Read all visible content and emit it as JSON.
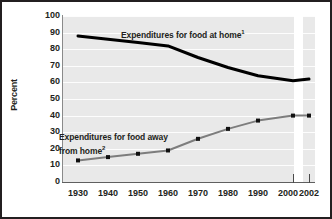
{
  "chart_data": {
    "type": "line",
    "title": "",
    "xlabel": "",
    "ylabel": "Percent",
    "ylim": [
      0,
      100
    ],
    "ytick_step": 10,
    "grid": true,
    "legend": "inline-labels",
    "axis_break_between": [
      "2000",
      "2002"
    ],
    "categories": [
      "1930",
      "1940",
      "1950",
      "1960",
      "1970",
      "1980",
      "1990",
      "2000",
      "2002"
    ],
    "series": [
      {
        "name": "Expenditures for food at home",
        "footnote": "1",
        "style": "thick-black-line-no-markers",
        "color": "#000000",
        "values": [
          88,
          86,
          84,
          82,
          75,
          69,
          64,
          61,
          62
        ]
      },
      {
        "name": "Expenditures for food away from home",
        "footnote": "2",
        "style": "gray-line-with-square-markers",
        "color": "#808080",
        "values": [
          13,
          15,
          17,
          19,
          26,
          32,
          37,
          40,
          40
        ]
      }
    ]
  },
  "axes": {
    "y_label": "Percent",
    "y_ticks": [
      "100",
      "90",
      "80",
      "70",
      "60",
      "50",
      "40",
      "30",
      "20",
      "10",
      "0"
    ],
    "x_ticks": [
      "1930",
      "1940",
      "1950",
      "1960",
      "1970",
      "1980",
      "1990",
      "2000",
      "2002"
    ]
  },
  "labels": {
    "at_home": "Expenditures for food at home",
    "at_home_footnote": "1",
    "away_from_home_line1": "Expenditures for food away",
    "away_from_home_line2": "from home",
    "away_from_home_footnote": "2"
  },
  "colors": {
    "plot_background": "#e9e9e9",
    "gridline": "#fdfdfd",
    "series_at_home": "#000000",
    "series_away_from_home": "#808080",
    "frame": "#231f20",
    "text": "#231f20"
  }
}
